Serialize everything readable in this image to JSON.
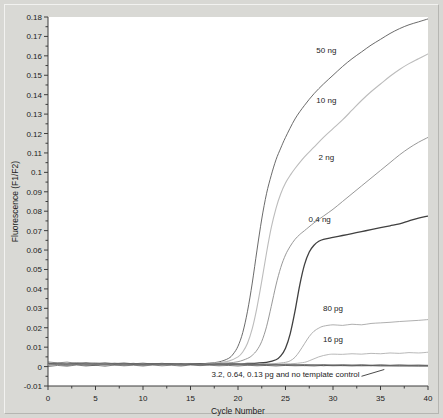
{
  "chart_data": {
    "type": "line",
    "title": "",
    "xlabel": "Cycle Number",
    "ylabel": "Fluorescence (F1/F2)",
    "xlim": [
      0,
      40
    ],
    "ylim": [
      -0.01,
      0.18
    ],
    "xticks": [
      0,
      5,
      10,
      15,
      20,
      25,
      30,
      35,
      40
    ],
    "xtick_labels": [
      "0",
      "5",
      "10",
      "15",
      "20",
      "25",
      "30",
      "35",
      "40"
    ],
    "xminor_step": 2.5,
    "yticks": [
      -0.01,
      0,
      0.01,
      0.02,
      0.03,
      0.04,
      0.05,
      0.06,
      0.07,
      0.08,
      0.09,
      0.1,
      0.11,
      0.12,
      0.13,
      0.14,
      0.15,
      0.16,
      0.17,
      0.18
    ],
    "ytick_labels": [
      "-0.01",
      "0",
      "0.01",
      "0.02",
      "0.03",
      "0.04",
      "0.05",
      "0.06",
      "0.07",
      "0.08",
      "0.09",
      "0.1",
      "0.11",
      "0.12",
      "0.13",
      "0.14",
      "0.15",
      "0.16",
      "0.17",
      "0.18"
    ],
    "grid": false,
    "legend": "inline-annotations",
    "series": [
      {
        "name": "50 ng",
        "color": "#5a5a5a",
        "width": 0.9,
        "label_x": 29.3,
        "label_y": 0.1615,
        "x": [
          0,
          1,
          2,
          3,
          4,
          5,
          6,
          7,
          8,
          9,
          10,
          11,
          12,
          13,
          14,
          15,
          16,
          17,
          18,
          19,
          19.5,
          20,
          20.5,
          21,
          21.5,
          22,
          22.5,
          23,
          23.5,
          24,
          24.5,
          25,
          26,
          27,
          28,
          29,
          30,
          31,
          32,
          33,
          34,
          35,
          36,
          37,
          38,
          39,
          40
        ],
        "y": [
          0.0015,
          0.0012,
          0.0016,
          0.0011,
          0.0014,
          0.001,
          0.0013,
          0.0009,
          0.0012,
          0.0014,
          0.001,
          0.0013,
          0.0011,
          0.0015,
          0.0012,
          0.0016,
          0.0014,
          0.0018,
          0.0024,
          0.0042,
          0.0065,
          0.0105,
          0.0175,
          0.0285,
          0.043,
          0.06,
          0.076,
          0.089,
          0.0985,
          0.1065,
          0.1125,
          0.118,
          0.1275,
          0.1345,
          0.1405,
          0.1455,
          0.15,
          0.1545,
          0.1585,
          0.162,
          0.1655,
          0.1685,
          0.1715,
          0.174,
          0.176,
          0.1775,
          0.179
        ]
      },
      {
        "name": "10 ng",
        "color": "#bcbcbc",
        "width": 1.1,
        "label_x": 29.3,
        "label_y": 0.1355,
        "x": [
          0,
          1,
          2,
          3,
          4,
          5,
          6,
          7,
          8,
          9,
          10,
          11,
          12,
          13,
          14,
          15,
          16,
          17,
          18,
          19,
          20,
          20.5,
          21,
          21.5,
          22,
          22.5,
          23,
          23.5,
          24,
          24.5,
          25,
          25.5,
          26,
          27,
          28,
          29,
          30,
          31,
          32,
          33,
          34,
          35,
          36,
          37,
          38,
          39,
          40
        ],
        "y": [
          0.0012,
          0.0015,
          0.0011,
          0.0014,
          0.001,
          0.0013,
          0.0009,
          0.0012,
          0.0015,
          0.0011,
          0.0013,
          0.001,
          0.0014,
          0.0012,
          0.0016,
          0.0013,
          0.0015,
          0.0017,
          0.002,
          0.0028,
          0.005,
          0.0075,
          0.012,
          0.0195,
          0.0305,
          0.044,
          0.0585,
          0.0715,
          0.0815,
          0.089,
          0.0945,
          0.0985,
          0.102,
          0.108,
          0.113,
          0.118,
          0.1225,
          0.127,
          0.132,
          0.137,
          0.1415,
          0.1455,
          0.1495,
          0.153,
          0.156,
          0.1585,
          0.161
        ]
      },
      {
        "name": "2 ng",
        "color": "#8c8c8c",
        "width": 0.9,
        "label_x": 29.3,
        "label_y": 0.1065,
        "x": [
          0,
          1,
          2,
          3,
          4,
          5,
          6,
          7,
          8,
          9,
          10,
          11,
          12,
          13,
          14,
          15,
          16,
          17,
          18,
          19,
          20,
          21,
          21.5,
          22,
          22.5,
          23,
          23.5,
          24,
          24.5,
          25,
          25.5,
          26,
          26.5,
          27,
          28,
          29,
          30,
          31,
          32,
          33,
          34,
          35,
          36,
          37,
          38,
          39,
          40
        ],
        "y": [
          0.0014,
          0.0011,
          0.0015,
          0.0012,
          0.0009,
          0.0013,
          0.0011,
          0.0014,
          0.001,
          0.0012,
          0.0015,
          0.0011,
          0.0013,
          0.001,
          0.0014,
          0.0012,
          0.0015,
          0.0013,
          0.0016,
          0.0019,
          0.0025,
          0.0042,
          0.0058,
          0.0085,
          0.013,
          0.0205,
          0.031,
          0.042,
          0.051,
          0.0575,
          0.062,
          0.0655,
          0.068,
          0.07,
          0.074,
          0.0775,
          0.081,
          0.085,
          0.089,
          0.093,
          0.097,
          0.101,
          0.105,
          0.109,
          0.1125,
          0.1155,
          0.118
        ]
      },
      {
        "name": "0.4 ng",
        "color": "#404040",
        "width": 1.3,
        "label_x": 28.6,
        "label_y": 0.0745,
        "x": [
          0,
          1,
          2,
          3,
          4,
          5,
          6,
          7,
          8,
          9,
          10,
          11,
          12,
          13,
          14,
          15,
          16,
          17,
          18,
          19,
          20,
          21,
          22,
          23,
          24,
          24.5,
          25,
          25.5,
          26,
          26.5,
          27,
          27.5,
          28,
          28.5,
          29,
          30,
          31,
          32,
          33,
          34,
          35,
          36,
          37,
          38,
          39,
          40
        ],
        "y": [
          0.0016,
          0.0013,
          0.001,
          0.0014,
          0.0012,
          0.0009,
          0.0013,
          0.0011,
          0.0015,
          0.0012,
          0.001,
          0.0014,
          0.0011,
          0.0013,
          0.001,
          0.0012,
          0.0014,
          0.0011,
          0.0013,
          0.0015,
          0.0014,
          0.0016,
          0.0018,
          0.0022,
          0.0035,
          0.0055,
          0.0095,
          0.017,
          0.0285,
          0.042,
          0.0525,
          0.059,
          0.0625,
          0.0645,
          0.0655,
          0.0665,
          0.0675,
          0.0685,
          0.0695,
          0.0705,
          0.0715,
          0.0725,
          0.0735,
          0.075,
          0.0765,
          0.0775
        ]
      },
      {
        "name": "80 pg",
        "color": "#9a9a9a",
        "width": 0.8,
        "label_x": 30.0,
        "label_y": 0.0285,
        "x": [
          0,
          2,
          4,
          6,
          8,
          10,
          12,
          14,
          16,
          18,
          20,
          22,
          23,
          24,
          25,
          25.5,
          26,
          26.5,
          27,
          27.5,
          28,
          28.5,
          29,
          30,
          31,
          32,
          33,
          34,
          35,
          36,
          37,
          38,
          39,
          40
        ],
        "y": [
          0.0011,
          0.0014,
          0.001,
          0.0013,
          0.0011,
          0.0015,
          0.0012,
          0.001,
          0.0013,
          0.0011,
          0.0014,
          0.0012,
          0.0013,
          0.0016,
          0.0022,
          0.003,
          0.0048,
          0.008,
          0.0118,
          0.0155,
          0.0182,
          0.0198,
          0.0208,
          0.0215,
          0.0212,
          0.0218,
          0.0215,
          0.0222,
          0.0225,
          0.0228,
          0.0232,
          0.0235,
          0.0238,
          0.0242
        ]
      },
      {
        "name": "16 pg",
        "color": "#a6a6a6",
        "width": 0.8,
        "label_x": 30.0,
        "label_y": 0.0125,
        "x": [
          0,
          2,
          4,
          6,
          8,
          10,
          12,
          14,
          16,
          18,
          20,
          22,
          24,
          25,
          26,
          27,
          27.5,
          28,
          28.5,
          29,
          29.5,
          30,
          31,
          32,
          33,
          34,
          35,
          36,
          37,
          38,
          39,
          40
        ],
        "y": [
          0.0013,
          0.001,
          0.0014,
          0.0011,
          0.0015,
          0.0012,
          0.001,
          0.0013,
          0.0011,
          0.0014,
          0.0012,
          0.0011,
          0.0013,
          0.0014,
          0.0016,
          0.0022,
          0.003,
          0.004,
          0.005,
          0.0057,
          0.0062,
          0.0064,
          0.0063,
          0.0066,
          0.0064,
          0.0068,
          0.0066,
          0.007,
          0.0068,
          0.0072,
          0.007,
          0.0074
        ]
      },
      {
        "name": "3.2 pg",
        "color": "#555555",
        "width": 0.7,
        "baseline": true,
        "x": [
          0,
          1,
          2,
          3,
          4,
          5,
          6,
          7,
          8,
          9,
          10,
          11,
          12,
          13,
          14,
          15,
          16,
          17,
          18,
          19,
          20,
          21,
          22,
          23,
          24,
          25,
          26,
          27,
          28,
          29,
          30,
          31,
          32,
          33,
          34,
          35,
          36,
          37,
          38,
          39,
          40
        ],
        "y": [
          0.0024,
          0.0019,
          0.0023,
          0.0017,
          0.0021,
          0.0016,
          0.002,
          0.0015,
          0.0019,
          0.0014,
          0.0018,
          0.0013,
          0.0017,
          0.0012,
          0.0016,
          0.0011,
          0.0015,
          0.001,
          0.0014,
          0.0009,
          0.0013,
          0.0008,
          0.0012,
          0.0007,
          0.0011,
          0.0006,
          0.001,
          0.0005,
          0.0009,
          0.0004,
          0.0008,
          0.0005,
          0.0007,
          0.0004,
          0.0006,
          0.0003,
          0.0005,
          0.0003,
          0.0004,
          0.0002,
          0.0003
        ]
      },
      {
        "name": "0.64 pg",
        "color": "#666666",
        "width": 0.7,
        "baseline": true,
        "x": [
          0,
          1,
          2,
          3,
          4,
          5,
          6,
          7,
          8,
          9,
          10,
          11,
          12,
          13,
          14,
          15,
          16,
          17,
          18,
          19,
          20,
          21,
          22,
          23,
          24,
          25,
          26,
          27,
          28,
          29,
          30,
          31,
          32,
          33,
          34,
          35,
          36,
          37,
          38,
          39,
          40
        ],
        "y": [
          0.0013,
          0.0018,
          0.0012,
          0.002,
          0.0014,
          0.0019,
          0.0012,
          0.0018,
          0.0013,
          0.0017,
          0.0011,
          0.0016,
          0.0012,
          0.0015,
          0.001,
          0.0014,
          0.0011,
          0.0013,
          0.0009,
          0.0013,
          0.001,
          0.0012,
          0.0008,
          0.0012,
          0.0009,
          0.0011,
          0.0007,
          0.0011,
          0.0008,
          0.001,
          0.0006,
          0.001,
          0.0007,
          0.0009,
          0.0005,
          0.0009,
          0.0006,
          0.0008,
          0.0005,
          0.0007,
          0.0005
        ]
      },
      {
        "name": "0.13 pg",
        "color": "#707070",
        "width": 0.7,
        "baseline": true,
        "x": [
          0,
          1,
          2,
          3,
          4,
          5,
          6,
          7,
          8,
          9,
          10,
          11,
          12,
          13,
          14,
          15,
          16,
          17,
          18,
          19,
          20,
          21,
          22,
          23,
          24,
          25,
          26,
          27,
          28,
          29,
          30,
          31,
          32,
          33,
          34,
          35,
          36,
          37,
          38,
          39,
          40
        ],
        "y": [
          0.0006,
          0.0012,
          0.0007,
          0.0013,
          0.0008,
          0.0012,
          0.0009,
          0.0014,
          0.0008,
          0.0013,
          0.0009,
          0.0012,
          0.001,
          0.0013,
          0.0009,
          0.0012,
          0.0008,
          0.0012,
          0.001,
          0.0011,
          0.0009,
          0.0011,
          0.001,
          0.001,
          0.0008,
          0.0011,
          0.0009,
          0.001,
          0.0007,
          0.001,
          0.0008,
          0.0009,
          0.0007,
          0.001,
          0.0008,
          0.0009,
          0.0007,
          0.0009,
          0.0008,
          0.0008,
          0.0007
        ]
      },
      {
        "name": "no template control",
        "color": "#4a4a4a",
        "width": 0.7,
        "baseline": true,
        "x": [
          0,
          1,
          2,
          3,
          4,
          5,
          6,
          7,
          8,
          9,
          10,
          11,
          12,
          13,
          14,
          15,
          16,
          17,
          18,
          19,
          20,
          21,
          22,
          23,
          24,
          25,
          26,
          27,
          28,
          29,
          30,
          31,
          32,
          33,
          34,
          35,
          36,
          37,
          38,
          39,
          40
        ],
        "y": [
          0.0,
          0.0006,
          0.0002,
          0.0008,
          0.0003,
          0.0007,
          0.0002,
          0.0008,
          0.0004,
          0.0007,
          0.0003,
          0.0008,
          0.0004,
          0.0007,
          0.0003,
          0.0008,
          0.0005,
          0.0007,
          0.0004,
          0.0006,
          0.0003,
          0.0007,
          0.0004,
          0.0006,
          0.0003,
          0.0006,
          0.0004,
          0.0005,
          0.0003,
          0.0006,
          0.0004,
          0.0005,
          0.0003,
          0.0005,
          0.0004,
          0.0005,
          0.0003,
          0.0004,
          0.0003,
          0.0004,
          0.0003
        ]
      }
    ],
    "annotations": [
      {
        "text": "3.2, 0.64, 0.13 pg and no template control",
        "x": 25.0,
        "y": -0.0055,
        "leader": {
          "x1": 33.0,
          "y1": -0.005,
          "x2": 35.4,
          "y2": -0.0015
        }
      }
    ]
  }
}
